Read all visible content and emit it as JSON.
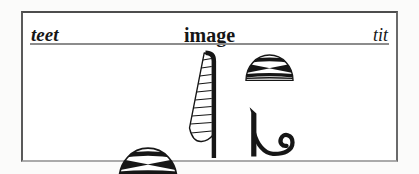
{
  "header": {
    "left_label": "teet",
    "center_label": "image",
    "right_label": "tit"
  },
  "glyphs": {
    "left_basket": "decorated-basket-hieroglyph",
    "feather": "hatched-feather-hieroglyph",
    "right_basket": "decorated-basket-hieroglyph",
    "coil": "coil-spiral-hieroglyph"
  },
  "colors": {
    "ink": "#161616",
    "panel_border": "#4d4d4d",
    "divider": "#8c8c8c",
    "panel_background": "#ffffff",
    "page_background": "#fbfbfa"
  }
}
